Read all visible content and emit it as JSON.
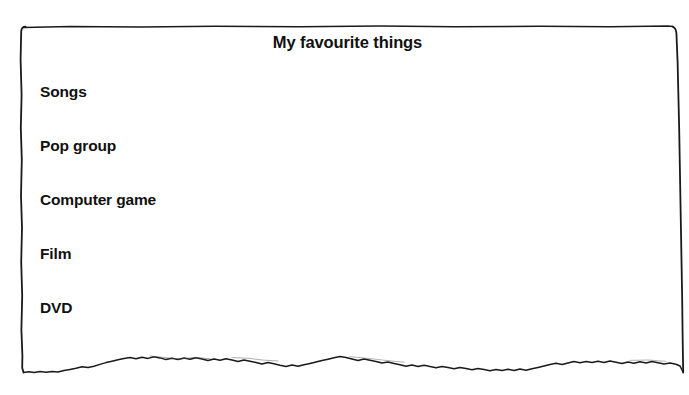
{
  "page": {
    "background_color": "#ffffff",
    "ink_color": "#111111",
    "width": 689,
    "height": 395
  },
  "worksheet": {
    "title": "My favourite things",
    "border": {
      "style": "hand-drawn-rectangle",
      "top_y": 26,
      "bottom_y": 372,
      "left_x": 22,
      "right_x": 683,
      "bottom_edge_style": "wobbly-sketch-line"
    },
    "items": [
      {
        "label": "Songs",
        "value": "",
        "top": 83
      },
      {
        "label": "Pop group",
        "value": "",
        "top": 137
      },
      {
        "label": "Computer game",
        "value": "",
        "top": 191
      },
      {
        "label": "Film",
        "value": "",
        "top": 245
      },
      {
        "label": "DVD",
        "value": "",
        "top": 299
      }
    ]
  }
}
